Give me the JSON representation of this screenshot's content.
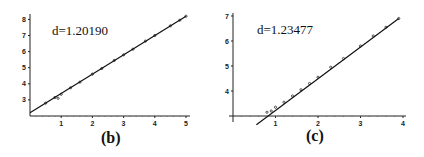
{
  "chart_data": [
    {
      "type": "line",
      "panel_label": "(b)",
      "annotation": "d=1.20190",
      "xlabel": "",
      "ylabel": "",
      "xlim": [
        0,
        5.1
      ],
      "ylim": [
        2.0,
        8.3
      ],
      "x_ticks": [
        1,
        2,
        3,
        4,
        5
      ],
      "y_ticks": [
        3,
        4,
        5,
        6,
        7,
        8
      ],
      "grid": false,
      "series": [
        {
          "name": "fit",
          "x": [
            0,
            5
          ],
          "values": [
            2.2,
            8.2
          ]
        },
        {
          "name": "data",
          "x": [
            0.5,
            0.8,
            0.9,
            1.0,
            1.3,
            1.6,
            2.0,
            2.3,
            2.7,
            3.0,
            3.3,
            3.7,
            4.0,
            4.5,
            4.8,
            5.0
          ],
          "values": [
            2.8,
            3.15,
            3.1,
            3.35,
            3.75,
            4.1,
            4.6,
            4.95,
            5.45,
            5.8,
            6.15,
            6.65,
            7.0,
            7.6,
            7.95,
            8.2
          ]
        }
      ]
    },
    {
      "type": "line",
      "panel_label": "(c)",
      "annotation": "d=1.23477",
      "xlabel": "",
      "ylabel": "",
      "xlim": [
        0,
        4.0
      ],
      "ylim": [
        3.0,
        7.1
      ],
      "x_ticks": [
        1,
        2,
        3,
        4
      ],
      "y_ticks": [
        4,
        5,
        6,
        7
      ],
      "grid": false,
      "series": [
        {
          "name": "fit",
          "x": [
            0.55,
            3.9
          ],
          "values": [
            2.65,
            6.9
          ]
        },
        {
          "name": "data",
          "x": [
            0.8,
            0.9,
            1.0,
            1.2,
            1.4,
            1.6,
            1.8,
            2.0,
            2.3,
            2.6,
            3.0,
            3.3,
            3.6,
            3.9
          ],
          "values": [
            3.15,
            3.2,
            3.35,
            3.55,
            3.8,
            4.05,
            4.3,
            4.55,
            4.95,
            5.3,
            5.8,
            6.2,
            6.55,
            6.9
          ]
        }
      ]
    }
  ],
  "panels": {
    "b": {
      "annotation": "d=1.20190",
      "label": "(b)",
      "x_ticks": [
        "1",
        "2",
        "3",
        "4",
        "5"
      ],
      "y_ticks": [
        "3",
        "4",
        "5",
        "6",
        "7",
        "8"
      ]
    },
    "c": {
      "annotation": "d=1.23477",
      "label": "(c)",
      "x_ticks": [
        "1",
        "2",
        "3",
        "4"
      ],
      "y_ticks": [
        "4",
        "5",
        "6",
        "7"
      ]
    }
  }
}
